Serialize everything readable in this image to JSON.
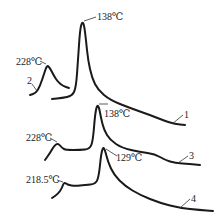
{
  "chart_data": {
    "type": "line",
    "title": "",
    "xlabel": "",
    "ylabel": "",
    "grid": false,
    "legend": "inline curve numbers",
    "series": [
      {
        "name": "1",
        "label": "1",
        "peaks": [
          {
            "temperature": "138℃",
            "value": 138
          }
        ],
        "points": [
          [
            52,
            99
          ],
          [
            62,
            98
          ],
          [
            72,
            96
          ],
          [
            76,
            88
          ],
          [
            78,
            60
          ],
          [
            80,
            30
          ],
          [
            82,
            22
          ],
          [
            84,
            24
          ],
          [
            86,
            40
          ],
          [
            88,
            60
          ],
          [
            92,
            78
          ],
          [
            98,
            90
          ],
          [
            110,
            100
          ],
          [
            130,
            108
          ],
          [
            150,
            115
          ],
          [
            165,
            121
          ],
          [
            175,
            124
          ],
          [
            185,
            125
          ]
        ]
      },
      {
        "name": "2",
        "label": "2",
        "peaks": [
          {
            "temperature": "228℃",
            "value": 228
          }
        ],
        "points": [
          [
            30,
            95
          ],
          [
            36,
            93
          ],
          [
            40,
            86
          ],
          [
            44,
            74
          ],
          [
            47,
            65
          ],
          [
            50,
            68
          ],
          [
            54,
            76
          ],
          [
            58,
            82
          ],
          [
            63,
            86
          ],
          [
            69,
            88
          ]
        ]
      },
      {
        "name": "3",
        "label": "3",
        "peaks": [
          {
            "temperature": "228℃",
            "value": 228
          },
          {
            "temperature": "138℃",
            "value": 138
          }
        ],
        "points": [
          [
            45,
            160
          ],
          [
            50,
            153
          ],
          [
            54,
            146
          ],
          [
            58,
            143
          ],
          [
            62,
            148
          ],
          [
            66,
            150
          ],
          [
            80,
            150
          ],
          [
            90,
            149
          ],
          [
            93,
            140
          ],
          [
            95,
            115
          ],
          [
            97,
            105
          ],
          [
            99,
            107
          ],
          [
            101,
            118
          ],
          [
            104,
            130
          ],
          [
            110,
            140
          ],
          [
            122,
            148
          ],
          [
            140,
            152
          ],
          [
            155,
            154
          ],
          [
            165,
            160
          ],
          [
            175,
            163
          ],
          [
            190,
            164
          ],
          [
            200,
            165
          ]
        ]
      },
      {
        "name": "4",
        "label": "4",
        "peaks": [
          {
            "temperature": "218.5℃",
            "value": 218.5
          },
          {
            "temperature": "129℃",
            "value": 129
          }
        ],
        "points": [
          [
            52,
            198
          ],
          [
            58,
            194
          ],
          [
            62,
            188
          ],
          [
            64,
            182
          ],
          [
            68,
            185
          ],
          [
            75,
            186
          ],
          [
            85,
            185
          ],
          [
            96,
            184
          ],
          [
            99,
            175
          ],
          [
            101,
            155
          ],
          [
            103,
            147
          ],
          [
            105,
            150
          ],
          [
            108,
            162
          ],
          [
            114,
            175
          ],
          [
            125,
            186
          ],
          [
            140,
            195
          ],
          [
            160,
            203
          ],
          [
            180,
            208
          ],
          [
            200,
            210
          ],
          [
            213,
            211
          ]
        ]
      }
    ],
    "annotations": [
      {
        "text": "138℃",
        "series": "1"
      },
      {
        "text": "228℃",
        "series": "2"
      },
      {
        "text": "138℃",
        "series": "3"
      },
      {
        "text": "228℃",
        "series": "3"
      },
      {
        "text": "129℃",
        "series": "4"
      },
      {
        "text": "218.5℃",
        "series": "4"
      }
    ]
  },
  "labels": {
    "c1_peak": "138℃",
    "c2_peak": "228℃",
    "c3_peak_high": "138℃",
    "c3_peak_low": "228℃",
    "c4_peak_high": "129℃",
    "c4_peak_low": "218.5℃",
    "c1_num": "1",
    "c2_num": "2",
    "c3_num": "3",
    "c4_num": "4"
  }
}
